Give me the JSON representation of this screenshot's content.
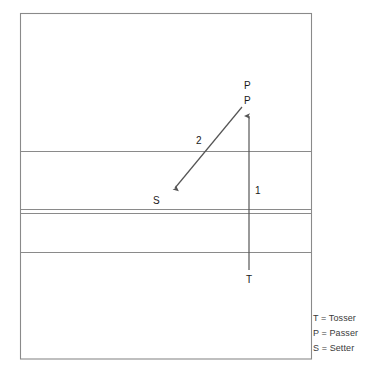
{
  "diagram": {
    "court": {
      "outline_color": "#8a8a8a",
      "line_color": "#8a8a8a",
      "fill_color": "#ffffff"
    },
    "arrow_color": "#555555",
    "labels": [
      {
        "name": "passer-label-top",
        "text": "P",
        "x": 244,
        "y": 81
      },
      {
        "name": "passer-label-bottom",
        "text": "P",
        "x": 244,
        "y": 96
      },
      {
        "name": "setter-label",
        "text": "S",
        "x": 153,
        "y": 196
      },
      {
        "name": "tosser-label",
        "text": "T",
        "x": 246,
        "y": 275
      },
      {
        "name": "path-label-one",
        "text": "1",
        "x": 255,
        "y": 186
      },
      {
        "name": "path-label-two",
        "text": "2",
        "x": 196,
        "y": 136
      }
    ],
    "legend": [
      {
        "name": "legend-tosser",
        "text": "T = Tosser"
      },
      {
        "name": "legend-passer",
        "text": "P = Passer"
      },
      {
        "name": "legend-setter",
        "text": "S = Setter"
      }
    ]
  }
}
